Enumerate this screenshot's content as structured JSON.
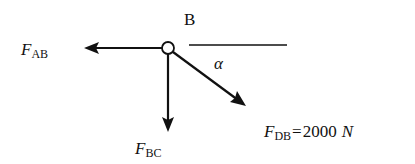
{
  "diagram": {
    "type": "free-body-diagram",
    "node": {
      "label": "B"
    },
    "angle_label": "α",
    "forces": [
      {
        "id": "AB",
        "symbol": "F",
        "subscript": "AB",
        "direction": "left"
      },
      {
        "id": "BC",
        "symbol": "F",
        "subscript": "BC",
        "direction": "down"
      },
      {
        "id": "DB",
        "symbol": "F",
        "subscript": "DB",
        "direction": "down-right",
        "equals": "=",
        "value": "2000",
        "unit": "N"
      }
    ],
    "colors": {
      "stroke": "#111111",
      "background": "#ffffff"
    }
  }
}
